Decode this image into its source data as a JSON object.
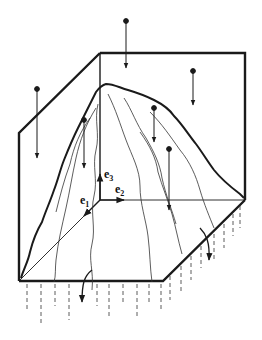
{
  "diagram": {
    "type": "3d-box-with-mountain-surface",
    "colors": {
      "stroke": "#1a1a1a",
      "background": "#ffffff"
    },
    "basis_vectors": [
      {
        "name": "e1",
        "base": "e",
        "subscript": "1"
      },
      {
        "name": "e2",
        "base": "e",
        "subscript": "2"
      },
      {
        "name": "e3",
        "base": "e",
        "subscript": "3"
      }
    ],
    "incoming_arrows": 6,
    "outgoing_curved_arrows": 2
  }
}
